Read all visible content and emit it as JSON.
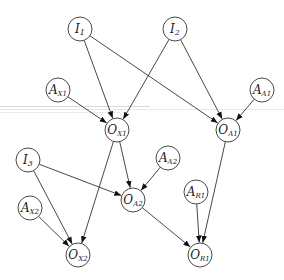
{
  "diagram": {
    "type": "directed-graph",
    "node_radius": 12,
    "colors": {
      "stroke": "#333333",
      "fill": "#ffffff",
      "background": "#ffffff",
      "band": "#d8d8d8"
    },
    "nodes": [
      {
        "id": "I1",
        "base": "I",
        "sub": "1",
        "x": 80,
        "y": 29
      },
      {
        "id": "I2",
        "base": "I",
        "sub": "2",
        "x": 175,
        "y": 29
      },
      {
        "id": "AX1",
        "base": "A",
        "sub": "X1",
        "x": 58,
        "y": 90
      },
      {
        "id": "AA1",
        "base": "A",
        "sub": "A1",
        "x": 262,
        "y": 90
      },
      {
        "id": "OX1",
        "base": "O",
        "sub": "X1",
        "x": 117,
        "y": 130
      },
      {
        "id": "OA1",
        "base": "O",
        "sub": "A1",
        "x": 228,
        "y": 130
      },
      {
        "id": "I3",
        "base": "I",
        "sub": "3",
        "x": 28,
        "y": 160
      },
      {
        "id": "AA2",
        "base": "A",
        "sub": "A2",
        "x": 168,
        "y": 158
      },
      {
        "id": "OA2",
        "base": "O",
        "sub": "A2",
        "x": 133,
        "y": 200
      },
      {
        "id": "AR1",
        "base": "A",
        "sub": "R1",
        "x": 196,
        "y": 192
      },
      {
        "id": "AX2",
        "base": "A",
        "sub": "X2",
        "x": 30,
        "y": 208
      },
      {
        "id": "OX2",
        "base": "O",
        "sub": "X2",
        "x": 78,
        "y": 255
      },
      {
        "id": "OR1",
        "base": "O",
        "sub": "R1",
        "x": 200,
        "y": 255
      }
    ],
    "edges": [
      {
        "from": "I1",
        "to": "OX1"
      },
      {
        "from": "I1",
        "to": "OA1"
      },
      {
        "from": "I2",
        "to": "OX1"
      },
      {
        "from": "I2",
        "to": "OA1"
      },
      {
        "from": "AX1",
        "to": "OX1"
      },
      {
        "from": "AA1",
        "to": "OA1"
      },
      {
        "from": "I3",
        "to": "OX2"
      },
      {
        "from": "I3",
        "to": "OA2"
      },
      {
        "from": "OX1",
        "to": "OA2"
      },
      {
        "from": "OX1",
        "to": "OX2"
      },
      {
        "from": "AA2",
        "to": "OA2"
      },
      {
        "from": "OA2",
        "to": "OR1"
      },
      {
        "from": "AR1",
        "to": "OR1"
      },
      {
        "from": "OA1",
        "to": "OR1"
      },
      {
        "from": "AX2",
        "to": "OX2"
      }
    ]
  }
}
